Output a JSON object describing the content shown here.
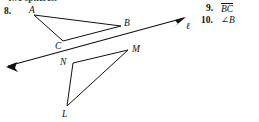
{
  "page": {
    "width": 259,
    "height": 122,
    "background": "#ffffff",
    "ink_color": "#111111",
    "clipped_top_text": "two spheres."
  },
  "exercises": {
    "left": {
      "number": "8.",
      "figure_name": "geometry-figure-triangles-and-line"
    },
    "right": [
      {
        "number": "9.",
        "value": "BC",
        "notation": "segment-overline"
      },
      {
        "number": "10.",
        "value": "∠B",
        "notation": "angle"
      }
    ]
  },
  "figure": {
    "labels": [
      {
        "name": "A",
        "text": "A",
        "x": 29,
        "y": 6
      },
      {
        "name": "B",
        "text": "B",
        "x": 124,
        "y": 19
      },
      {
        "name": "C",
        "text": "C",
        "x": 55,
        "y": 42
      },
      {
        "name": "M",
        "text": "M",
        "x": 132,
        "y": 45
      },
      {
        "name": "N",
        "text": "N",
        "x": 60,
        "y": 58
      },
      {
        "name": "L",
        "text": "L",
        "x": 62,
        "y": 110
      },
      {
        "name": "ell",
        "text": "ℓ",
        "x": 186,
        "y": 22
      }
    ],
    "triangle_abc": {
      "A": [
        34,
        15
      ],
      "B": [
        121,
        26
      ],
      "C": [
        63,
        41
      ]
    },
    "triangle_lmn": {
      "L": [
        67,
        106
      ],
      "M": [
        128,
        50
      ],
      "N": [
        73,
        63
      ]
    },
    "line_ell": {
      "from": [
        8,
        66
      ],
      "to": [
        184,
        18
      ],
      "arrows": "both"
    }
  }
}
